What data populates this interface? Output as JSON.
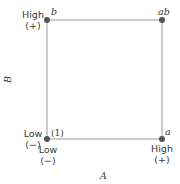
{
  "diagram": {
    "type": "2^2 factorial design square",
    "axes": {
      "x_label": "A",
      "y_label": "B"
    },
    "corners": [
      {
        "id": "one",
        "label": "(1)",
        "A": "Low",
        "B": "Low"
      },
      {
        "id": "a",
        "label": "a",
        "A": "High",
        "B": "Low"
      },
      {
        "id": "b",
        "label": "b",
        "A": "Low",
        "B": "High"
      },
      {
        "id": "ab",
        "label": "ab",
        "A": "High",
        "B": "High"
      }
    ],
    "levels": {
      "b_high": {
        "text": "High",
        "sign": "(+)"
      },
      "b_low": {
        "text": "Low",
        "sign": "(−)"
      },
      "a_low": {
        "text": "Low",
        "sign": "(−)"
      },
      "a_high": {
        "text": "High",
        "sign": "(+)"
      }
    },
    "colors": {
      "line": "#9a9a9a",
      "point": "#555555",
      "text": "#3a3a3a"
    }
  }
}
